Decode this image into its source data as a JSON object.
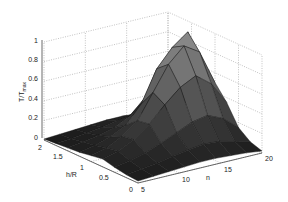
{
  "chart_data": {
    "type": "surface3d",
    "title": "",
    "xlabel": "h/R",
    "ylabel": "n",
    "zlabel": "T/T_max",
    "zlabel_main": "T/T",
    "zlabel_sub": "max",
    "xlim": [
      0,
      2
    ],
    "ylim": [
      5,
      20
    ],
    "zlim": [
      0,
      1
    ],
    "x_ticks": [
      "0",
      "0.5",
      "1",
      "1.5",
      "2"
    ],
    "y_ticks": [
      "5",
      "10",
      "15",
      "20"
    ],
    "z_ticks": [
      "0",
      "0.2",
      "0.4",
      "0.6",
      "0.8",
      "1"
    ],
    "grid": true,
    "colormap": "gray",
    "surface": {
      "x": [
        0,
        0.25,
        0.5,
        0.75,
        1.0,
        1.25,
        1.5,
        1.75,
        2.0
      ],
      "y": [
        5,
        6.875,
        8.75,
        10.625,
        12.5,
        14.375,
        16.25,
        18.125,
        20
      ],
      "z": [
        [
          0.02,
          0.03,
          0.05,
          0.08,
          0.06,
          0.04,
          0.03,
          0.02,
          0.01
        ],
        [
          0.03,
          0.05,
          0.08,
          0.12,
          0.1,
          0.07,
          0.05,
          0.03,
          0.02
        ],
        [
          0.04,
          0.07,
          0.12,
          0.2,
          0.18,
          0.12,
          0.08,
          0.05,
          0.03
        ],
        [
          0.05,
          0.1,
          0.18,
          0.32,
          0.3,
          0.2,
          0.12,
          0.07,
          0.04
        ],
        [
          0.06,
          0.13,
          0.25,
          0.48,
          0.55,
          0.38,
          0.2,
          0.1,
          0.05
        ],
        [
          0.06,
          0.15,
          0.32,
          0.62,
          0.8,
          0.7,
          0.35,
          0.12,
          0.05
        ],
        [
          0.05,
          0.14,
          0.35,
          0.7,
          0.95,
          0.88,
          0.45,
          0.12,
          0.04
        ],
        [
          0.04,
          0.1,
          0.28,
          0.58,
          0.85,
          1.0,
          0.4,
          0.1,
          0.03
        ],
        [
          0.02,
          0.06,
          0.15,
          0.35,
          0.5,
          0.55,
          0.25,
          0.06,
          0.02
        ]
      ]
    }
  },
  "axes": {
    "z_ticks": [
      "0",
      "0.2",
      "0.4",
      "0.6",
      "0.8",
      "1"
    ],
    "x_ticks": [
      "2",
      "1.5",
      "1",
      "0.5",
      "0"
    ],
    "y_ticks": [
      "5",
      "10",
      "15",
      "20"
    ],
    "x_label": "h/R",
    "y_label": "n",
    "z_label_main": "T/T",
    "z_label_sub": "max"
  }
}
